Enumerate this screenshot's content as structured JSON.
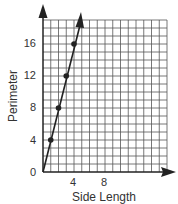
{
  "chart_data": {
    "type": "line",
    "title": "",
    "xlabel": "Side Length",
    "ylabel": "Perimeter",
    "xlim": [
      0,
      16
    ],
    "ylim": [
      0,
      19
    ],
    "x_ticks": [
      4,
      8
    ],
    "y_ticks": [
      0,
      4,
      8,
      12,
      16
    ],
    "grid": true,
    "grid_step_x": 1,
    "grid_step_y": 1,
    "series": [
      {
        "name": "Perimeter",
        "points": [
          {
            "x": 1,
            "y": 4
          },
          {
            "x": 2,
            "y": 8
          },
          {
            "x": 3,
            "y": 12
          },
          {
            "x": 4,
            "y": 16
          }
        ],
        "line_from": {
          "x": 0,
          "y": 0
        },
        "line_to_arrow": {
          "x": 4.75,
          "y": 19
        }
      }
    ],
    "colors": {
      "grid": "#555555",
      "line": "#222222",
      "text": "#333333"
    }
  },
  "labels": {
    "xlabel": "Side Length",
    "ylabel": "Perimeter",
    "origin": "0",
    "x_tick_4": "4",
    "x_tick_8": "8",
    "y_tick_4": "4",
    "y_tick_8": "8",
    "y_tick_12": "12",
    "y_tick_16": "16"
  }
}
